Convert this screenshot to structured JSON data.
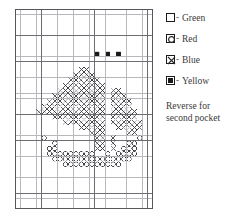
{
  "chart_data": {
    "type": "heatmap",
    "title": "",
    "xlabel": "",
    "ylabel": "",
    "grid": {
      "cols": 26,
      "rows": 38,
      "bold_every": 5,
      "grid_on": true
    },
    "symbols": {
      "blank": "Green",
      "circle": "Red",
      "cross": "Blue",
      "filled": "Yellow"
    },
    "colors": {
      "grid_light": "#b9b9bd",
      "grid_bold": "#6e6e72",
      "border": "#58585c",
      "symbol": "#3d3d44",
      "filled": "#1a1a1a",
      "background": "#ffffff"
    },
    "cells": {
      "filled": [
        [
          8,
          15
        ],
        [
          8,
          17
        ],
        [
          8,
          19
        ]
      ],
      "cross": [
        [
          11,
          12
        ],
        [
          11,
          13
        ],
        [
          12,
          11
        ],
        [
          12,
          12
        ],
        [
          12,
          13
        ],
        [
          12,
          14
        ],
        [
          13,
          10
        ],
        [
          13,
          11
        ],
        [
          13,
          12
        ],
        [
          13,
          13
        ],
        [
          13,
          14
        ],
        [
          13,
          15
        ],
        [
          14,
          9
        ],
        [
          14,
          10
        ],
        [
          14,
          11
        ],
        [
          14,
          12
        ],
        [
          14,
          13
        ],
        [
          14,
          14
        ],
        [
          14,
          15
        ],
        [
          14,
          16
        ],
        [
          15,
          8
        ],
        [
          15,
          9
        ],
        [
          15,
          10
        ],
        [
          15,
          11
        ],
        [
          15,
          12
        ],
        [
          15,
          13
        ],
        [
          15,
          14
        ],
        [
          15,
          15
        ],
        [
          15,
          16
        ],
        [
          15,
          18
        ],
        [
          15,
          19
        ],
        [
          16,
          7
        ],
        [
          16,
          8
        ],
        [
          16,
          9
        ],
        [
          16,
          10
        ],
        [
          16,
          11
        ],
        [
          16,
          12
        ],
        [
          16,
          13
        ],
        [
          16,
          14
        ],
        [
          16,
          15
        ],
        [
          16,
          16
        ],
        [
          16,
          18
        ],
        [
          16,
          19
        ],
        [
          16,
          20
        ],
        [
          17,
          6
        ],
        [
          17,
          7
        ],
        [
          17,
          8
        ],
        [
          17,
          9
        ],
        [
          17,
          10
        ],
        [
          17,
          11
        ],
        [
          17,
          12
        ],
        [
          17,
          13
        ],
        [
          17,
          14
        ],
        [
          17,
          15
        ],
        [
          17,
          16
        ],
        [
          17,
          18
        ],
        [
          17,
          19
        ],
        [
          17,
          20
        ],
        [
          17,
          21
        ],
        [
          18,
          5
        ],
        [
          18,
          6
        ],
        [
          18,
          7
        ],
        [
          18,
          8
        ],
        [
          18,
          9
        ],
        [
          18,
          10
        ],
        [
          18,
          11
        ],
        [
          18,
          12
        ],
        [
          18,
          13
        ],
        [
          18,
          14
        ],
        [
          18,
          15
        ],
        [
          18,
          16
        ],
        [
          18,
          18
        ],
        [
          18,
          19
        ],
        [
          18,
          20
        ],
        [
          18,
          21
        ],
        [
          19,
          4
        ],
        [
          19,
          5
        ],
        [
          19,
          6
        ],
        [
          19,
          7
        ],
        [
          19,
          8
        ],
        [
          19,
          9
        ],
        [
          19,
          10
        ],
        [
          19,
          11
        ],
        [
          19,
          12
        ],
        [
          19,
          13
        ],
        [
          19,
          14
        ],
        [
          19,
          15
        ],
        [
          19,
          16
        ],
        [
          19,
          18
        ],
        [
          19,
          19
        ],
        [
          19,
          20
        ],
        [
          19,
          21
        ],
        [
          19,
          22
        ],
        [
          20,
          7
        ],
        [
          20,
          8
        ],
        [
          20,
          9
        ],
        [
          20,
          10
        ],
        [
          20,
          11
        ],
        [
          20,
          12
        ],
        [
          20,
          13
        ],
        [
          20,
          14
        ],
        [
          20,
          15
        ],
        [
          20,
          16
        ],
        [
          20,
          18
        ],
        [
          20,
          19
        ],
        [
          20,
          20
        ],
        [
          20,
          21
        ],
        [
          20,
          22
        ],
        [
          21,
          9
        ],
        [
          21,
          10
        ],
        [
          21,
          11
        ],
        [
          21,
          12
        ],
        [
          21,
          13
        ],
        [
          21,
          14
        ],
        [
          21,
          15
        ],
        [
          21,
          16
        ],
        [
          21,
          18
        ],
        [
          21,
          19
        ],
        [
          21,
          20
        ],
        [
          21,
          21
        ],
        [
          21,
          22
        ],
        [
          21,
          23
        ],
        [
          22,
          12
        ],
        [
          22,
          13
        ],
        [
          22,
          14
        ],
        [
          22,
          15
        ],
        [
          22,
          16
        ],
        [
          22,
          19
        ],
        [
          22,
          20
        ],
        [
          22,
          21
        ],
        [
          22,
          22
        ],
        [
          22,
          23
        ],
        [
          23,
          14
        ],
        [
          23,
          15
        ],
        [
          23,
          16
        ],
        [
          23,
          21
        ],
        [
          23,
          22
        ],
        [
          24,
          15
        ],
        [
          24,
          16
        ],
        [
          24,
          18
        ],
        [
          25,
          15
        ],
        [
          25,
          16
        ],
        [
          25,
          18
        ],
        [
          26,
          15
        ],
        [
          26,
          16
        ],
        [
          26,
          18
        ]
      ],
      "circle": [
        [
          24,
          5
        ],
        [
          24,
          23
        ],
        [
          25,
          7
        ],
        [
          25,
          21
        ],
        [
          25,
          22
        ],
        [
          26,
          6
        ],
        [
          26,
          7
        ],
        [
          26,
          20
        ],
        [
          26,
          21
        ],
        [
          26,
          22
        ],
        [
          27,
          6
        ],
        [
          27,
          7
        ],
        [
          27,
          8
        ],
        [
          27,
          9
        ],
        [
          27,
          10
        ],
        [
          27,
          11
        ],
        [
          27,
          12
        ],
        [
          27,
          13
        ],
        [
          27,
          14
        ],
        [
          27,
          17
        ],
        [
          27,
          19
        ],
        [
          27,
          20
        ],
        [
          27,
          21
        ],
        [
          27,
          22
        ],
        [
          28,
          7
        ],
        [
          28,
          8
        ],
        [
          28,
          9
        ],
        [
          28,
          10
        ],
        [
          28,
          11
        ],
        [
          28,
          12
        ],
        [
          28,
          13
        ],
        [
          28,
          14
        ],
        [
          28,
          15
        ],
        [
          28,
          16
        ],
        [
          28,
          17
        ],
        [
          28,
          18
        ],
        [
          28,
          19
        ],
        [
          28,
          20
        ],
        [
          28,
          21
        ],
        [
          29,
          9
        ],
        [
          29,
          10
        ],
        [
          29,
          11
        ],
        [
          29,
          12
        ],
        [
          29,
          13
        ],
        [
          29,
          14
        ],
        [
          29,
          15
        ],
        [
          29,
          16
        ],
        [
          29,
          17
        ],
        [
          29,
          18
        ],
        [
          29,
          19
        ]
      ]
    }
  },
  "legend": {
    "dash": "-",
    "items": [
      {
        "symbol": "blank",
        "icon": "empty-square-icon",
        "label": "Green"
      },
      {
        "symbol": "circle",
        "icon": "circle-square-icon",
        "label": "Red"
      },
      {
        "symbol": "cross",
        "icon": "cross-square-icon",
        "label": "Blue"
      },
      {
        "symbol": "filled",
        "icon": "filled-square-icon",
        "label": "Yellow"
      }
    ]
  },
  "note": {
    "line1": "Reverse for",
    "line2": "second pocket"
  }
}
